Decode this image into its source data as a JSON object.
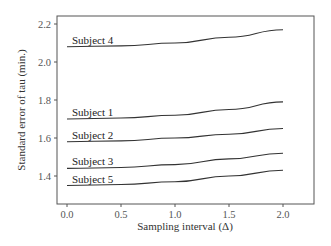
{
  "chart_data": {
    "type": "line",
    "title": "",
    "xlabel": "Sampling interval (Δ)",
    "ylabel": "Standard error of tau (min.)",
    "xlim": [
      -0.1,
      2.2
    ],
    "ylim": [
      1.25,
      2.24
    ],
    "xticks": [
      "0.0",
      "0.5",
      "1.0",
      "1.5",
      "2.0"
    ],
    "yticks": [
      "1.4",
      "1.6",
      "1.8",
      "2.0",
      "2.2"
    ],
    "grid": false,
    "legend": "inline labels at left of each curve",
    "x": [
      0.0,
      0.5,
      1.0,
      1.5,
      2.0
    ],
    "series": [
      {
        "name": "Subject 4",
        "values": [
          2.08,
          2.085,
          2.1,
          2.13,
          2.17
        ]
      },
      {
        "name": "Subject 1",
        "values": [
          1.7,
          1.705,
          1.72,
          1.75,
          1.79
        ]
      },
      {
        "name": "Subject 2",
        "values": [
          1.58,
          1.585,
          1.6,
          1.62,
          1.65
        ]
      },
      {
        "name": "Subject 3",
        "values": [
          1.44,
          1.445,
          1.46,
          1.49,
          1.52
        ]
      },
      {
        "name": "Subject 5",
        "values": [
          1.35,
          1.355,
          1.37,
          1.4,
          1.43
        ]
      }
    ]
  }
}
